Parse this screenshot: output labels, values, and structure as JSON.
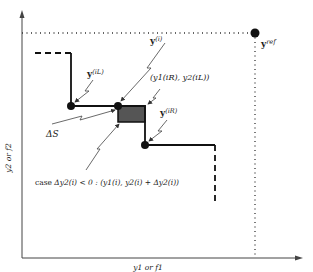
{
  "diagram": {
    "type": "pareto-front-hypervolume-illustration",
    "axes": {
      "x_label": "y1 or f1",
      "y_label": "y2 or f2"
    },
    "reference_point": {
      "label": "ref",
      "prefix": "y"
    },
    "points": {
      "y_iL": {
        "base": "y",
        "sup": "(iL)"
      },
      "y_i": {
        "base": "y",
        "sup": "(i)"
      },
      "y_iR": {
        "base": "y",
        "sup": "(iR)"
      }
    },
    "corner_label": "(y1(iR), y2(iL))",
    "area_label": "ΔS",
    "case_label": {
      "prefix": "case",
      "condition": "Δy2(i) < 0 :",
      "point": "(y1(i), y2(i) + Δy2(i))"
    },
    "colors": {
      "line": "#111111",
      "shaded_area": "#555555",
      "background": "#ffffff"
    }
  }
}
